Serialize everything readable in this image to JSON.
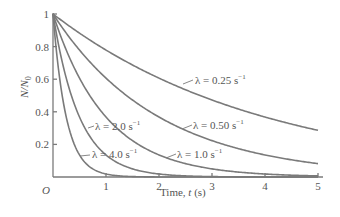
{
  "chart_data": {
    "type": "line",
    "title": "",
    "xlabel": "Time, t (s)",
    "ylabel": "N/N0",
    "xlim": [
      0,
      5
    ],
    "ylim": [
      0,
      1
    ],
    "grid": false,
    "legend": "inline curve labels",
    "origin_label": "O",
    "x_ticks": [
      1,
      2,
      3,
      4,
      5
    ],
    "y_ticks": [
      0.2,
      0.4,
      0.6,
      0.8,
      1
    ],
    "x_tick_labels": [
      "1",
      "2",
      "3",
      "4",
      "5"
    ],
    "y_tick_labels": [
      "0.2",
      "0.4",
      "0.6",
      "0.8",
      "1"
    ],
    "function": "N/N0 = exp(-lambda * t)",
    "series": [
      {
        "name": "λ = 0.25 s⁻¹",
        "lambda": 0.25,
        "x": [
          0,
          1,
          2,
          3,
          4,
          5
        ],
        "values": [
          1.0,
          0.78,
          0.61,
          0.47,
          0.37,
          0.29
        ]
      },
      {
        "name": "λ = 0.50 s⁻¹",
        "lambda": 0.5,
        "x": [
          0,
          1,
          2,
          3,
          4,
          5
        ],
        "values": [
          1.0,
          0.61,
          0.37,
          0.22,
          0.14,
          0.08
        ]
      },
      {
        "name": "λ = 1.0 s⁻¹",
        "lambda": 1.0,
        "x": [
          0,
          1,
          2,
          3,
          4,
          5
        ],
        "values": [
          1.0,
          0.37,
          0.14,
          0.05,
          0.02,
          0.01
        ]
      },
      {
        "name": "λ = 2.0 s⁻¹",
        "lambda": 2.0,
        "x": [
          0,
          1,
          2,
          3,
          4,
          5
        ],
        "values": [
          1.0,
          0.14,
          0.02,
          0.0,
          0.0,
          0.0
        ]
      },
      {
        "name": "λ = 4.0 s⁻¹",
        "lambda": 4.0,
        "x": [
          0,
          1,
          2,
          3,
          4,
          5
        ],
        "values": [
          1.0,
          0.02,
          0.0,
          0.0,
          0.0,
          0.0
        ]
      }
    ]
  },
  "labels": {
    "curve_0": {
      "lambda": "λ = 0.25 s",
      "exp": "−1"
    },
    "curve_1": {
      "lambda": "λ = 0.50 s",
      "exp": "−1"
    },
    "curve_2": {
      "lambda": "λ = 1.0 s",
      "exp": "−1"
    },
    "curve_3": {
      "lambda": "λ = 2.0 s",
      "exp": "−1"
    },
    "curve_4": {
      "lambda": "λ = 4.0 s",
      "exp": "−1"
    }
  }
}
